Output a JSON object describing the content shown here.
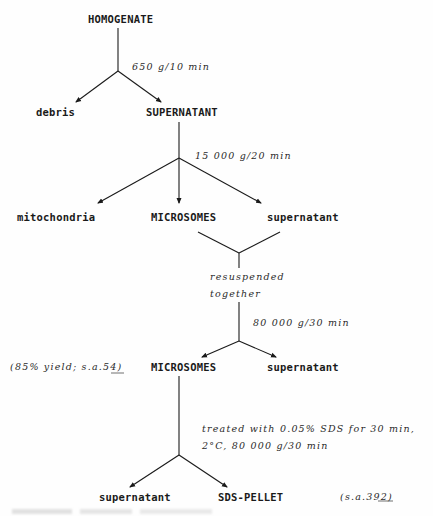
{
  "diagram": {
    "type": "fractionation-flowchart",
    "nodes": {
      "homogenate": "HOMOGENATE",
      "debris": "debris",
      "supernatant1": "SUPERNATANT",
      "mitochondria": "mitochondria",
      "microsomes1": "MICROSOMES",
      "supernatant2": "supernatant",
      "microsomes2": "MICROSOMES",
      "supernatant3": "supernatant",
      "supernatant4": "supernatant",
      "sds_pellet": "SDS-PELLET"
    },
    "conditions": {
      "step1": "650 g/10 min",
      "step2": "15 000 g/20 min",
      "resuspend_line1": "resuspended",
      "resuspend_line2": "together",
      "step3": "80 000 g/30 min",
      "step4_line1": "treated with 0.05% SDS for 30 min,",
      "step4_line2": "2°C, 80 000 g/30 min"
    },
    "annotations": {
      "microsomes_yield_prefix": "(85% yield; s.a.",
      "microsomes_sa_value": "54",
      "microsomes_yield_suffix": ")",
      "pellet_sa_prefix": "(s.a.",
      "pellet_sa_value": "392",
      "pellet_sa_suffix": ")"
    },
    "edges": [
      {
        "from": "HOMOGENATE",
        "to": "debris",
        "condition": "650 g/10 min"
      },
      {
        "from": "HOMOGENATE",
        "to": "SUPERNATANT",
        "condition": "650 g/10 min"
      },
      {
        "from": "SUPERNATANT",
        "to": "mitochondria",
        "condition": "15 000 g/20 min"
      },
      {
        "from": "SUPERNATANT",
        "to": "MICROSOMES",
        "condition": "15 000 g/20 min"
      },
      {
        "from": "SUPERNATANT",
        "to": "supernatant",
        "condition": "15 000 g/20 min"
      },
      {
        "from": "MICROSOMES + supernatant",
        "to": "resuspended together",
        "condition": ""
      },
      {
        "from": "resuspended together",
        "to": "MICROSOMES (85% yield; s.a.54)",
        "condition": "80 000 g/30 min"
      },
      {
        "from": "resuspended together",
        "to": "supernatant",
        "condition": "80 000 g/30 min"
      },
      {
        "from": "MICROSOMES",
        "to": "supernatant",
        "condition": "treated with 0.05% SDS for 30 min, 2°C, 80 000 g/30 min"
      },
      {
        "from": "MICROSOMES",
        "to": "SDS-PELLET (s.a.392)",
        "condition": "treated with 0.05% SDS for 30 min, 2°C, 80 000 g/30 min"
      }
    ],
    "colors": {
      "ink": "#1a1a1a",
      "background": "#fefefe"
    }
  }
}
